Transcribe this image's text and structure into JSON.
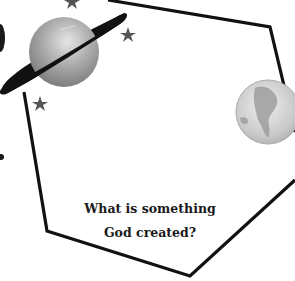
{
  "card": {
    "shape": "hexagon",
    "question_line1": "What is something",
    "question_line2": "God created?",
    "border_color": "#111111"
  },
  "decorations": {
    "planet": "ringed-planet",
    "stars": [
      "star",
      "star",
      "star"
    ],
    "globe": "earth-globe"
  }
}
